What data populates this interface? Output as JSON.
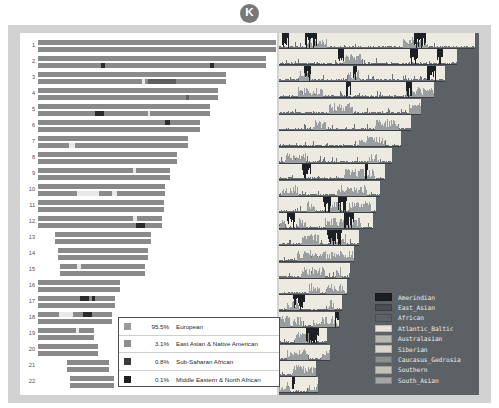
{
  "badge": {
    "label": "K"
  },
  "chart_data": {
    "type": "bar",
    "subtitle": "",
    "xlabel": "",
    "ylabel": "Chromosome",
    "legend_position": "inset-bottom-left",
    "grid": false,
    "categories": [
      "1",
      "2",
      "3",
      "4",
      "5",
      "6",
      "7",
      "8",
      "9",
      "10",
      "11",
      "12",
      "13",
      "14",
      "15",
      "16",
      "17",
      "18",
      "19",
      "20",
      "21",
      "22"
    ],
    "chromosome_rows": [
      {
        "number": "1",
        "top": 6,
        "start": 18,
        "width": 238,
        "offset": 0
      },
      {
        "number": "2",
        "top": 22,
        "start": 18,
        "width": 228,
        "offset": 0
      },
      {
        "number": "3",
        "top": 38,
        "start": 18,
        "width": 188,
        "offset": 0
      },
      {
        "number": "4",
        "top": 54,
        "start": 18,
        "width": 180,
        "offset": 0
      },
      {
        "number": "5",
        "top": 70,
        "start": 18,
        "width": 172,
        "offset": 0
      },
      {
        "number": "6",
        "top": 86,
        "start": 18,
        "width": 162,
        "offset": 0
      },
      {
        "number": "7",
        "top": 102,
        "start": 18,
        "width": 150,
        "offset": 0
      },
      {
        "number": "8",
        "top": 118,
        "start": 18,
        "width": 139,
        "offset": 0
      },
      {
        "number": "9",
        "top": 134,
        "start": 18,
        "width": 132,
        "offset": 0
      },
      {
        "number": "10",
        "top": 150,
        "start": 18,
        "width": 127,
        "offset": 0
      },
      {
        "number": "11",
        "top": 166,
        "start": 18,
        "width": 126,
        "offset": 0
      },
      {
        "number": "12",
        "top": 182,
        "start": 18,
        "width": 124,
        "offset": 0
      },
      {
        "number": "13",
        "top": 198,
        "start": 35,
        "width": 96,
        "offset": 17
      },
      {
        "number": "14",
        "top": 214,
        "start": 38,
        "width": 90,
        "offset": 20
      },
      {
        "number": "15",
        "top": 230,
        "start": 40,
        "width": 85,
        "offset": 22
      },
      {
        "number": "16",
        "top": 246,
        "start": 18,
        "width": 82,
        "offset": 0
      },
      {
        "number": "17",
        "top": 262,
        "start": 18,
        "width": 77,
        "offset": 0
      },
      {
        "number": "18",
        "top": 278,
        "start": 18,
        "width": 74,
        "offset": 0
      },
      {
        "number": "19",
        "top": 294,
        "start": 18,
        "width": 56,
        "offset": 0
      },
      {
        "number": "20",
        "top": 310,
        "start": 18,
        "width": 60,
        "offset": 0
      },
      {
        "number": "21",
        "top": 326,
        "start": 47,
        "width": 42,
        "offset": 29
      },
      {
        "number": "22",
        "top": 342,
        "start": 50,
        "width": 44,
        "offset": 32
      }
    ],
    "ancestry_segments": [
      {
        "row": 1,
        "hap": 1,
        "x": 63,
        "w": 4,
        "tone": "dark"
      },
      {
        "row": 1,
        "hap": 1,
        "x": 172,
        "w": 4,
        "tone": "dark"
      },
      {
        "row": 2,
        "hap": 1,
        "x": 104,
        "w": 3,
        "tone": "light"
      },
      {
        "row": 2,
        "hap": 1,
        "x": 110,
        "w": 28,
        "tone": "mid"
      },
      {
        "row": 3,
        "hap": 1,
        "x": 148,
        "w": 3,
        "tone": "mid"
      },
      {
        "row": 4,
        "hap": 1,
        "x": 57,
        "w": 9,
        "tone": "dark"
      },
      {
        "row": 4,
        "hap": 1,
        "x": 110,
        "w": 2,
        "tone": "light"
      },
      {
        "row": 5,
        "hap": 0,
        "x": 127,
        "w": 5,
        "tone": "dark"
      },
      {
        "row": 6,
        "hap": 1,
        "x": 31,
        "w": 6,
        "tone": "light"
      },
      {
        "row": 8,
        "hap": 0,
        "x": 95,
        "w": 3,
        "tone": "light"
      },
      {
        "row": 9,
        "hap": 1,
        "x": 39,
        "w": 22,
        "tone": "light"
      },
      {
        "row": 9,
        "hap": 1,
        "x": 74,
        "w": 5,
        "tone": "light"
      },
      {
        "row": 11,
        "hap": 0,
        "x": 95,
        "w": 4,
        "tone": "light"
      },
      {
        "row": 11,
        "hap": 1,
        "x": 98,
        "w": 9,
        "tone": "dark"
      },
      {
        "row": 14,
        "hap": 0,
        "x": 17,
        "w": 4,
        "tone": "light"
      },
      {
        "row": 16,
        "hap": 0,
        "x": 42,
        "w": 9,
        "tone": "dark"
      },
      {
        "row": 16,
        "hap": 0,
        "x": 54,
        "w": 3,
        "tone": "dark"
      },
      {
        "row": 17,
        "hap": 0,
        "x": 45,
        "w": 9,
        "tone": "dark"
      },
      {
        "row": 17,
        "hap": 0,
        "x": 21,
        "w": 14,
        "tone": "light"
      },
      {
        "row": 18,
        "hap": 0,
        "x": 38,
        "w": 3,
        "tone": "light"
      }
    ],
    "population_probability_rows": [
      {
        "width": 196,
        "height": 16
      },
      {
        "width": 178,
        "height": 16
      },
      {
        "width": 166,
        "height": 16
      },
      {
        "width": 155,
        "height": 16
      },
      {
        "width": 142,
        "height": 16
      },
      {
        "width": 132,
        "height": 16
      },
      {
        "width": 122,
        "height": 16
      },
      {
        "width": 113,
        "height": 16
      },
      {
        "width": 106,
        "height": 16
      },
      {
        "width": 101,
        "height": 16
      },
      {
        "width": 97,
        "height": 16
      },
      {
        "width": 94,
        "height": 16
      },
      {
        "width": 80,
        "height": 16
      },
      {
        "width": 75,
        "height": 16
      },
      {
        "width": 71,
        "height": 16
      },
      {
        "width": 68,
        "height": 16
      },
      {
        "width": 63,
        "height": 16
      },
      {
        "width": 60,
        "height": 16
      },
      {
        "width": 48,
        "height": 16
      },
      {
        "width": 51,
        "height": 16
      },
      {
        "width": 37,
        "height": 16
      },
      {
        "width": 39,
        "height": 16
      }
    ]
  },
  "percent_legend": {
    "items": [
      {
        "value": "95.5%",
        "label": "European",
        "color": "#9a9a9a"
      },
      {
        "value": "3.1%",
        "label": "East Asian & Native American",
        "color": "#8d8d8d"
      },
      {
        "value": "0.8%",
        "label": "Sub-Saharan African",
        "color": "#3a3a3a"
      },
      {
        "value": "0.1%",
        "label": "Middle Eastern & North African",
        "color": "#1f1f1f"
      }
    ]
  },
  "population_legend": {
    "items": [
      {
        "label": "Amerindian",
        "color": "#1c1f22"
      },
      {
        "label": "East_Asian",
        "color": "#4a4f53"
      },
      {
        "label": "African",
        "color": "#5c6166"
      },
      {
        "label": "Atlantic_Baltic",
        "color": "#e6e4db"
      },
      {
        "label": "Australasian",
        "color": "#b9b9b3"
      },
      {
        "label": "Siberian",
        "color": "#d8d6cd"
      },
      {
        "label": "Caucasus_Gedrosia",
        "color": "#8b8f90"
      },
      {
        "label": "Southern",
        "color": "#c3c2ba"
      },
      {
        "label": "South_Asian",
        "color": "#a3a6a5"
      }
    ]
  },
  "colors": {
    "frame": "#d2d2d2",
    "panel_background": "#ffffff",
    "probability_background": "#5c6166",
    "probability_row": "#eceae1",
    "haplotype_bar": "#8a8a8a",
    "badge": "#787878"
  }
}
